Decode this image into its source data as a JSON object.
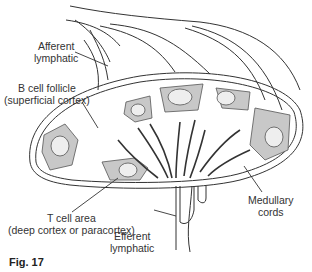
{
  "figure": {
    "caption": "Fig. 17"
  },
  "labels": {
    "afferent": {
      "line1": "Afferent",
      "line2": "lymphatic"
    },
    "b_cell": {
      "line1": "B cell follicle",
      "line2": "(superficial cortex)"
    },
    "t_cell": {
      "line1": "T cell area",
      "line2": "(deep cortex or paracortex)"
    },
    "efferent": {
      "line1": "Efferent",
      "line2": "lymphatic"
    },
    "medullary": {
      "line1": "Medullary",
      "line2": "cords"
    }
  },
  "colors": {
    "outline": "#333333",
    "follicle_fill": "#c8c8c8",
    "germinal_center": "#eeeeee",
    "cord": "#333333"
  }
}
